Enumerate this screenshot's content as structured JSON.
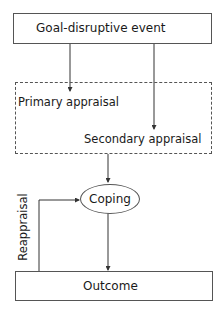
{
  "diagram": {
    "nodes": {
      "event": {
        "label": "Goal-disruptive event"
      },
      "appraisal_group": {
        "primary": {
          "label": "Primary appraisal"
        },
        "secondary": {
          "label": "Secondary appraisal"
        }
      },
      "coping": {
        "label": "Coping"
      },
      "outcome": {
        "label": "Outcome"
      }
    },
    "edges": [
      {
        "from": "Goal-disruptive event",
        "to": "Primary appraisal"
      },
      {
        "from": "Goal-disruptive event",
        "to": "Secondary appraisal"
      },
      {
        "from": "Appraisal group",
        "to": "Coping"
      },
      {
        "from": "Coping",
        "to": "Outcome"
      },
      {
        "from": "Outcome",
        "to": "Coping",
        "label": "Reappraisal"
      }
    ],
    "feedback_label": "Reappraisal"
  }
}
